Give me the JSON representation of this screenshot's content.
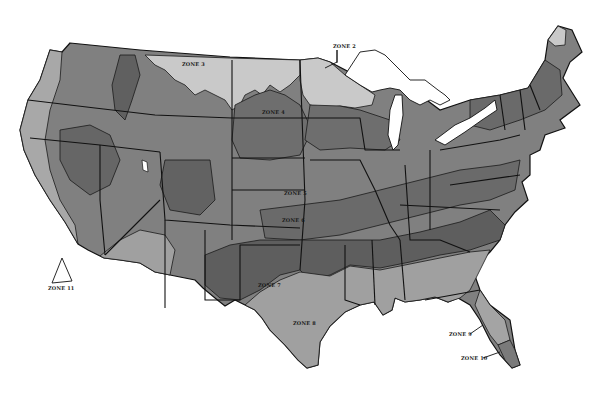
{
  "map": {
    "title": "USDA Plant Hardiness Zone Map (Continental US, grayscale)",
    "background": "#ffffff",
    "colors": {
      "zone_light": "#c9c9c9",
      "zone_medium_light": "#9c9c9c",
      "zone_medium": "#8a8a8a",
      "zone_medium_dark": "#767676",
      "zone_dark": "#5e5e5e",
      "outline": "#111111",
      "water": "#ffffff"
    },
    "labels": [
      {
        "id": "zone2",
        "text": "ZONE 2",
        "x": 333,
        "y": 48
      },
      {
        "id": "zone3",
        "text": "ZONE 3",
        "x": 182,
        "y": 66
      },
      {
        "id": "zone4",
        "text": "ZONE 4",
        "x": 262,
        "y": 114
      },
      {
        "id": "zone5",
        "text": "ZONE 5",
        "x": 284,
        "y": 195
      },
      {
        "id": "zone6",
        "text": "ZONE 6",
        "x": 282,
        "y": 222
      },
      {
        "id": "zone7",
        "text": "ZONE 7",
        "x": 258,
        "y": 287
      },
      {
        "id": "zone8",
        "text": "ZONE 8",
        "x": 293,
        "y": 325
      },
      {
        "id": "zone9",
        "text": "ZONE 9",
        "x": 449,
        "y": 336
      },
      {
        "id": "zone10",
        "text": "ZONE 10",
        "x": 461,
        "y": 360
      },
      {
        "id": "zone11",
        "text": "ZONE 11",
        "x": 48,
        "y": 290
      }
    ]
  }
}
